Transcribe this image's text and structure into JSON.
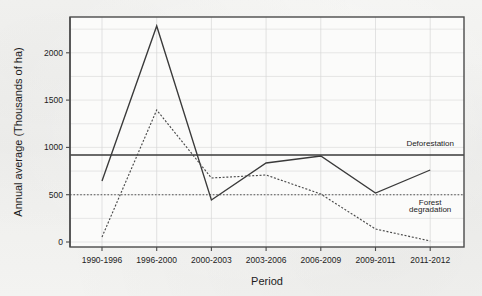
{
  "chart_data": {
    "type": "line",
    "title": "",
    "xlabel": "Period",
    "ylabel": "Annual average (Thousands of ha)",
    "categories": [
      "1990-1996",
      "1996-2000",
      "2000-2003",
      "2003-2006",
      "2006-2009",
      "2009-2011",
      "2011-2012"
    ],
    "ylim": [
      0,
      2350
    ],
    "yticks": [
      0,
      500,
      1000,
      1500,
      2000
    ],
    "ytick_labels": [
      "0",
      "500",
      "1000",
      "1500",
      "2000"
    ],
    "grid": true,
    "grid_minor_step": 250,
    "legend_position": "inline-annotations",
    "series": [
      {
        "name": "Deforestation",
        "style": "solid",
        "color": "#3a3a3a",
        "values": [
          645,
          2283,
          444,
          835,
          909,
          518,
          761
        ]
      },
      {
        "name": "Forest degradation",
        "style": "dotted",
        "color": "#4a4a4a",
        "values": [
          53,
          1395,
          677,
          708,
          507,
          137,
          11
        ]
      }
    ],
    "reference_lines": [
      {
        "name": "Deforestation average",
        "value": 920,
        "style": "solid",
        "color": "#3a3a3a"
      },
      {
        "name": "Forest degradation average",
        "value": 500,
        "style": "dotted",
        "color": "#555555"
      }
    ],
    "annotations": [
      {
        "text": "Deforestation",
        "x_category": "2011-2012",
        "y_value": 1010
      },
      {
        "text": "Forest",
        "x_category": "2011-2012",
        "y_value": 390
      },
      {
        "text": "degradation",
        "x_category": "2011-2012",
        "y_value": 315
      }
    ]
  }
}
